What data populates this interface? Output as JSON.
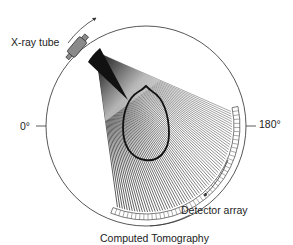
{
  "diagram": {
    "title": "Computed Tomography",
    "labels": {
      "xray_tube": "X-ray tube",
      "angle_start": "0°",
      "angle_end": "180°",
      "detector_array": "Detector array"
    },
    "components": [
      {
        "id": "gantry-circle",
        "description": "circular gantry path"
      },
      {
        "id": "xray-tube",
        "description": "X-ray tube on gantry, upper-left"
      },
      {
        "id": "fan-beam",
        "description": "fan of X-ray beams from tube through patient head"
      },
      {
        "id": "head-outline",
        "description": "cross-section outline of patient head"
      },
      {
        "id": "detector-array",
        "description": "curved segmented detector array, lower-right"
      },
      {
        "id": "rotation-arrow-tube",
        "description": "clockwise rotation arrow near tube"
      },
      {
        "id": "rotation-arrow-detector",
        "description": "rotation arrow near detector array"
      }
    ],
    "colors": {
      "line": "#333333",
      "tube_fill": "#8a8a8a",
      "beam_dark": "#111111",
      "background": "#ffffff"
    }
  }
}
